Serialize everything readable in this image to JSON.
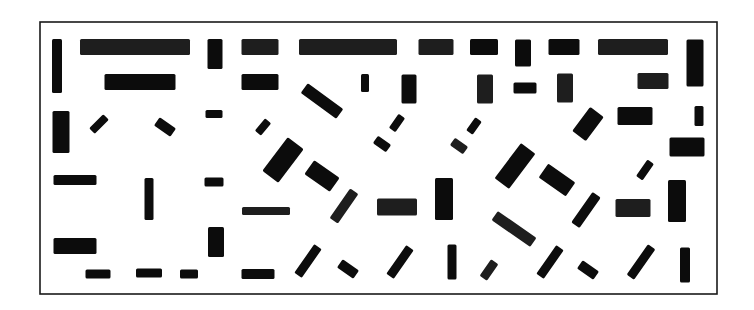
{
  "figure": {
    "frame": {
      "x": 40,
      "y": 22,
      "w": 677,
      "h": 272,
      "stroke": "#1a1a1a"
    },
    "bar_color": "#0c0c0c",
    "bars": [
      {
        "cx": 57,
        "cy": 66,
        "w": 10,
        "h": 54,
        "angle": 0,
        "textured": false
      },
      {
        "cx": 135,
        "cy": 47,
        "w": 110,
        "h": 16,
        "angle": 0,
        "textured": true
      },
      {
        "cx": 215,
        "cy": 54,
        "w": 15,
        "h": 30,
        "angle": 0,
        "textured": false
      },
      {
        "cx": 260,
        "cy": 47,
        "w": 37,
        "h": 16,
        "angle": 0,
        "textured": true
      },
      {
        "cx": 348,
        "cy": 47,
        "w": 98,
        "h": 16,
        "angle": 0,
        "textured": true
      },
      {
        "cx": 436,
        "cy": 47,
        "w": 35,
        "h": 16,
        "angle": 0,
        "textured": true
      },
      {
        "cx": 484,
        "cy": 47,
        "w": 28,
        "h": 16,
        "angle": 0,
        "textured": false
      },
      {
        "cx": 523,
        "cy": 53,
        "w": 16,
        "h": 27,
        "angle": 0,
        "textured": false
      },
      {
        "cx": 564,
        "cy": 47,
        "w": 31,
        "h": 16,
        "angle": 0,
        "textured": false
      },
      {
        "cx": 633,
        "cy": 47,
        "w": 70,
        "h": 16,
        "angle": 0,
        "textured": true
      },
      {
        "cx": 695,
        "cy": 63,
        "w": 17,
        "h": 47,
        "angle": 0,
        "textured": false
      },
      {
        "cx": 140,
        "cy": 82,
        "w": 71,
        "h": 16,
        "angle": 0,
        "textured": false
      },
      {
        "cx": 260,
        "cy": 82,
        "w": 37,
        "h": 16,
        "angle": 0,
        "textured": false
      },
      {
        "cx": 365,
        "cy": 83,
        "w": 8,
        "h": 18,
        "angle": 0,
        "textured": false
      },
      {
        "cx": 322,
        "cy": 101,
        "w": 44,
        "h": 12,
        "angle": 36,
        "textured": false
      },
      {
        "cx": 409,
        "cy": 89,
        "w": 15,
        "h": 29,
        "angle": 0,
        "textured": false
      },
      {
        "cx": 485,
        "cy": 89,
        "w": 16,
        "h": 29,
        "angle": 0,
        "textured": true
      },
      {
        "cx": 525,
        "cy": 88,
        "w": 23,
        "h": 11,
        "angle": 0,
        "textured": false
      },
      {
        "cx": 565,
        "cy": 88,
        "w": 16,
        "h": 29,
        "angle": 0,
        "textured": true
      },
      {
        "cx": 653,
        "cy": 81,
        "w": 31,
        "h": 16,
        "angle": 0,
        "textured": true
      },
      {
        "cx": 61,
        "cy": 132,
        "w": 17,
        "h": 42,
        "angle": 0,
        "textured": false
      },
      {
        "cx": 99,
        "cy": 124,
        "w": 8,
        "h": 20,
        "angle": 45,
        "textured": false
      },
      {
        "cx": 165,
        "cy": 127,
        "w": 20,
        "h": 10,
        "angle": 35,
        "textured": false
      },
      {
        "cx": 214,
        "cy": 114,
        "w": 17,
        "h": 8,
        "angle": 0,
        "textured": false
      },
      {
        "cx": 263,
        "cy": 127,
        "w": 8,
        "h": 16,
        "angle": 40,
        "textured": false
      },
      {
        "cx": 397,
        "cy": 123,
        "w": 8,
        "h": 17,
        "angle": 35,
        "textured": false
      },
      {
        "cx": 382,
        "cy": 144,
        "w": 16,
        "h": 9,
        "angle": 35,
        "textured": false
      },
      {
        "cx": 474,
        "cy": 126,
        "w": 8,
        "h": 16,
        "angle": 35,
        "textured": false
      },
      {
        "cx": 459,
        "cy": 146,
        "w": 16,
        "h": 9,
        "angle": 35,
        "textured": true
      },
      {
        "cx": 588,
        "cy": 124,
        "w": 17,
        "h": 30,
        "angle": 37,
        "textured": false
      },
      {
        "cx": 635,
        "cy": 116,
        "w": 35,
        "h": 18,
        "angle": 0,
        "textured": false
      },
      {
        "cx": 699,
        "cy": 116,
        "w": 9,
        "h": 20,
        "angle": 0,
        "textured": false
      },
      {
        "cx": 687,
        "cy": 147,
        "w": 35,
        "h": 19,
        "angle": 0,
        "textured": false
      },
      {
        "cx": 283,
        "cy": 160,
        "w": 20,
        "h": 42,
        "angle": 37,
        "textured": false
      },
      {
        "cx": 322,
        "cy": 176,
        "w": 31,
        "h": 17,
        "angle": 35,
        "textured": false
      },
      {
        "cx": 515,
        "cy": 166,
        "w": 18,
        "h": 44,
        "angle": 37,
        "textured": false
      },
      {
        "cx": 557,
        "cy": 180,
        "w": 33,
        "h": 17,
        "angle": 35,
        "textured": false
      },
      {
        "cx": 645,
        "cy": 170,
        "w": 8,
        "h": 20,
        "angle": 35,
        "textured": false
      },
      {
        "cx": 75,
        "cy": 180,
        "w": 43,
        "h": 10,
        "angle": 0,
        "textured": false
      },
      {
        "cx": 149,
        "cy": 199,
        "w": 9,
        "h": 42,
        "angle": 0,
        "textured": false
      },
      {
        "cx": 214,
        "cy": 182,
        "w": 19,
        "h": 9,
        "angle": 0,
        "textured": false
      },
      {
        "cx": 266,
        "cy": 211,
        "w": 48,
        "h": 8,
        "angle": 0,
        "textured": true
      },
      {
        "cx": 344,
        "cy": 206,
        "w": 10,
        "h": 36,
        "angle": 35,
        "textured": true
      },
      {
        "cx": 397,
        "cy": 207,
        "w": 40,
        "h": 17,
        "angle": 0,
        "textured": true
      },
      {
        "cx": 444,
        "cy": 199,
        "w": 18,
        "h": 42,
        "angle": 0,
        "textured": false
      },
      {
        "cx": 586,
        "cy": 210,
        "w": 10,
        "h": 37,
        "angle": 35,
        "textured": false
      },
      {
        "cx": 633,
        "cy": 208,
        "w": 35,
        "h": 18,
        "angle": 0,
        "textured": true
      },
      {
        "cx": 677,
        "cy": 201,
        "w": 18,
        "h": 42,
        "angle": 0,
        "textured": false
      },
      {
        "cx": 75,
        "cy": 246,
        "w": 43,
        "h": 16,
        "angle": 0,
        "textured": false
      },
      {
        "cx": 216,
        "cy": 242,
        "w": 16,
        "h": 30,
        "angle": 0,
        "textured": false
      },
      {
        "cx": 514,
        "cy": 229,
        "w": 47,
        "h": 11,
        "angle": 35,
        "textured": true
      },
      {
        "cx": 98,
        "cy": 274,
        "w": 25,
        "h": 9,
        "angle": 0,
        "textured": false
      },
      {
        "cx": 149,
        "cy": 273,
        "w": 26,
        "h": 9,
        "angle": 0,
        "textured": false
      },
      {
        "cx": 189,
        "cy": 274,
        "w": 18,
        "h": 9,
        "angle": 0,
        "textured": false
      },
      {
        "cx": 258,
        "cy": 274,
        "w": 33,
        "h": 10,
        "angle": 0,
        "textured": false
      },
      {
        "cx": 308,
        "cy": 261,
        "w": 9,
        "h": 35,
        "angle": 35,
        "textured": false
      },
      {
        "cx": 348,
        "cy": 269,
        "w": 20,
        "h": 10,
        "angle": 35,
        "textured": false
      },
      {
        "cx": 400,
        "cy": 262,
        "w": 9,
        "h": 35,
        "angle": 35,
        "textured": false
      },
      {
        "cx": 452,
        "cy": 262,
        "w": 9,
        "h": 35,
        "angle": 0,
        "textured": false
      },
      {
        "cx": 489,
        "cy": 270,
        "w": 9,
        "h": 20,
        "angle": 35,
        "textured": true
      },
      {
        "cx": 550,
        "cy": 262,
        "w": 9,
        "h": 35,
        "angle": 35,
        "textured": false
      },
      {
        "cx": 588,
        "cy": 270,
        "w": 20,
        "h": 10,
        "angle": 35,
        "textured": false
      },
      {
        "cx": 641,
        "cy": 262,
        "w": 9,
        "h": 37,
        "angle": 35,
        "textured": false
      },
      {
        "cx": 685,
        "cy": 265,
        "w": 10,
        "h": 35,
        "angle": 0,
        "textured": false
      }
    ]
  }
}
